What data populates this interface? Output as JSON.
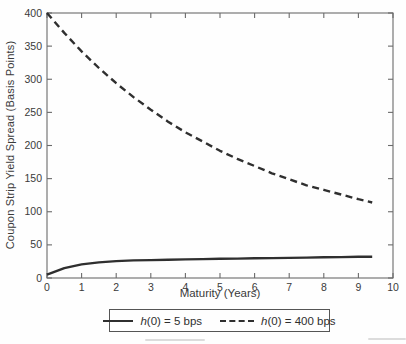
{
  "figure": {
    "y_axis_title": "Coupon Strip Yield Spread (Basis Points)",
    "x_axis_title": "Maturity (Years)"
  },
  "legend": {
    "items": [
      {
        "symbol": "solid-line",
        "label_italic": "h",
        "label_rest": "(0) = 5 bps"
      },
      {
        "symbol": "dashed-line",
        "label_italic": "h",
        "label_rest": "(0) = 400 bps"
      }
    ]
  },
  "colors": {
    "line": "#2f2f2f",
    "axis": "#6b6b6b",
    "text": "#3a3a3a",
    "background": "#fefefe"
  },
  "chart_data": {
    "type": "line",
    "title": "",
    "xlabel": "Maturity (Years)",
    "ylabel": "Coupon Strip Yield Spread (Basis Points)",
    "xlim": [
      0,
      10
    ],
    "ylim": [
      0,
      400
    ],
    "xticks": [
      0,
      1,
      2,
      3,
      4,
      5,
      6,
      7,
      8,
      9,
      10
    ],
    "yticks": [
      0,
      50,
      100,
      150,
      200,
      250,
      300,
      350,
      400
    ],
    "grid": false,
    "frame": "box-with-inward-ticks",
    "legend_position": "bottom-outside",
    "series": [
      {
        "name": "h(0) = 5 bps",
        "style": "solid",
        "x": [
          0,
          0.5,
          1,
          1.5,
          2,
          2.5,
          3,
          3.5,
          4,
          4.5,
          5,
          5.5,
          6,
          6.5,
          7,
          7.5,
          8,
          8.5,
          9,
          9.4
        ],
        "y": [
          5,
          15,
          20.5,
          23.5,
          25.5,
          26.5,
          27,
          27.5,
          28,
          28.5,
          29,
          29.3,
          29.7,
          30,
          30.4,
          30.8,
          31.2,
          31.6,
          32,
          32.2
        ]
      },
      {
        "name": "h(0) = 400 bps",
        "style": "dashed",
        "x": [
          0,
          0.5,
          1,
          1.5,
          2,
          2.5,
          3,
          3.5,
          4,
          4.5,
          5,
          5.5,
          6,
          6.5,
          7,
          7.5,
          8,
          8.5,
          9,
          9.4
        ],
        "y": [
          400,
          370,
          342,
          317,
          294,
          273,
          254,
          236,
          220,
          206,
          192,
          180,
          169,
          158,
          149,
          140,
          133,
          126,
          119,
          114
        ]
      }
    ]
  }
}
